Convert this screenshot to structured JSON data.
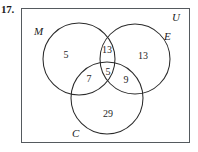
{
  "problem": {
    "number": "17."
  },
  "diagram": {
    "type": "venn-3-set",
    "universe_label": "U",
    "sets": [
      {
        "key": "M",
        "label": "M",
        "name": "left-circle"
      },
      {
        "key": "E",
        "label": "E",
        "name": "right-circle"
      },
      {
        "key": "C",
        "label": "C",
        "name": "bottom-circle"
      }
    ],
    "regions": [
      {
        "key": "M_only",
        "label": "M only",
        "value": "5"
      },
      {
        "key": "M_E",
        "label": "M and E only",
        "value": "13"
      },
      {
        "key": "E_only",
        "label": "E only",
        "value": "13"
      },
      {
        "key": "M_C",
        "label": "M and C only",
        "value": "7"
      },
      {
        "key": "M_E_C",
        "label": "M and E and C",
        "value": "5"
      },
      {
        "key": "E_C",
        "label": "E and C only",
        "value": "9"
      },
      {
        "key": "C_only",
        "label": "C only",
        "value": "29"
      }
    ],
    "geometry": {
      "rect": {
        "x": 21,
        "y": 8,
        "width": 169,
        "height": 135
      },
      "circles": [
        {
          "key": "M",
          "cx": 79,
          "cy": 59,
          "r": 36
        },
        {
          "key": "E",
          "cx": 135,
          "cy": 59,
          "r": 35
        },
        {
          "key": "C",
          "cx": 107,
          "cy": 98,
          "r": 36
        }
      ]
    },
    "colors": {
      "stroke": "#2b2b2b",
      "rect_stroke": "#555a5e",
      "text": "#1a1a1a",
      "background": "#ffffff"
    }
  }
}
